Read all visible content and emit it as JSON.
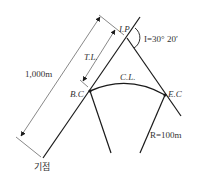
{
  "diagram": {
    "type": "simple curve geometry",
    "labels": {
      "ip": "I.P",
      "intersection_angle": "I=30° 20′",
      "tangent_length": "T.L.",
      "curve_length": "C.L.",
      "bc": "B.C",
      "ec": "E.C",
      "radius": "R=100m",
      "distance": "1,000m",
      "origin": "기점"
    },
    "colors": {
      "line": "#1a1a1a",
      "text": "#333333",
      "background": "#ffffff"
    }
  }
}
